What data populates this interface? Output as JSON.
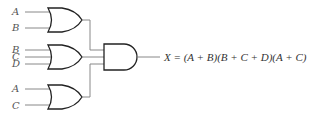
{
  "diagram": {
    "type": "logic-circuit",
    "gates": [
      {
        "id": "or1",
        "kind": "OR",
        "inputs": [
          "A",
          "B"
        ]
      },
      {
        "id": "or2",
        "kind": "OR",
        "inputs": [
          "B",
          "C",
          "D"
        ]
      },
      {
        "id": "or3",
        "kind": "OR",
        "inputs": [
          "A",
          "C"
        ]
      },
      {
        "id": "and1",
        "kind": "AND",
        "inputs": [
          "or1",
          "or2",
          "or3"
        ]
      }
    ],
    "labels": {
      "or1_a": "A",
      "or1_b": "B",
      "or2_b": "B",
      "or2_c": "C",
      "or2_d": "D",
      "or3_a": "A",
      "or3_c": "C"
    },
    "output_expression": "X = (A + B)(B + C + D)(A + C)"
  }
}
